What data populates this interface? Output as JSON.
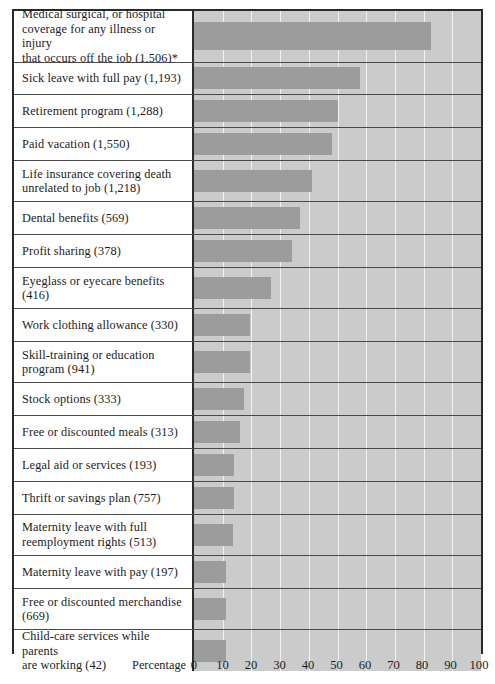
{
  "axis": {
    "caption": "Percentage",
    "ticks": [
      "0",
      "10",
      "20",
      "30",
      "40",
      "50",
      "60",
      "70",
      "80",
      "90",
      "100"
    ]
  },
  "colors": {
    "bar": "#9c9c9c",
    "plot_background": "#cbcbcb",
    "gridline": "#f2f2f2",
    "frame": "#2a2a2a",
    "text": "#1c1c1c"
  },
  "chart_data": {
    "type": "bar",
    "orientation": "horizontal",
    "title": "",
    "xlabel": "Percentage",
    "ylabel": "",
    "xlim": [
      0,
      100
    ],
    "grid": true,
    "legend": null,
    "footnote": "*",
    "categories": [
      "Medical surgical, or hospital coverage for any illness or injury that occurs off the job (1,506)*",
      "Sick leave with full pay (1,193)",
      "Retirement program (1,288)",
      "Paid vacation (1,550)",
      "Life insurance covering death unrelated to job (1,218)",
      "Dental benefits (569)",
      "Profit sharing (378)",
      "Eyeglass or eyecare benefits (416)",
      "Work clothing allowance (330)",
      "Skill-training or education program (941)",
      "Stock options (333)",
      "Free or discounted meals (313)",
      "Legal aid or services (193)",
      "Thrift or savings plan (757)",
      "Maternity leave with full reemployment rights (513)",
      "Maternity leave with pay (197)",
      "Free or discounted merchandise (669)",
      "Child-care services while parents are working (42)"
    ],
    "values": [
      82.5,
      58,
      50,
      48,
      41,
      37,
      34,
      27,
      19.5,
      19.5,
      17.5,
      16,
      14,
      14,
      13.5,
      11,
      11,
      11
    ],
    "counts": [
      1506,
      1193,
      1288,
      1550,
      1218,
      569,
      378,
      416,
      330,
      941,
      333,
      313,
      193,
      757,
      513,
      197,
      669,
      42
    ]
  },
  "rows": [
    {
      "label_line1": "Medical surgical, or hospital",
      "label_line2": "coverage for any illness or injury",
      "label_line3": "that occurs off the job (1,506)*",
      "value": 82.5,
      "lines": 3
    },
    {
      "label_line1": "Sick leave with full pay (1,193)",
      "label_line2": "",
      "label_line3": "",
      "value": 58,
      "lines": 1
    },
    {
      "label_line1": "Retirement program (1,288)",
      "label_line2": "",
      "label_line3": "",
      "value": 50,
      "lines": 1
    },
    {
      "label_line1": "Paid vacation (1,550)",
      "label_line2": "",
      "label_line3": "",
      "value": 48,
      "lines": 1
    },
    {
      "label_line1": "Life insurance covering death",
      "label_line2": "unrelated to job (1,218)",
      "label_line3": "",
      "value": 41,
      "lines": 2
    },
    {
      "label_line1": "Dental benefits (569)",
      "label_line2": "",
      "label_line3": "",
      "value": 37,
      "lines": 1
    },
    {
      "label_line1": "Profit sharing (378)",
      "label_line2": "",
      "label_line3": "",
      "value": 34,
      "lines": 1
    },
    {
      "label_line1": "Eyeglass or eyecare benefits",
      "label_line2": "(416)",
      "label_line3": "",
      "value": 27,
      "lines": 2
    },
    {
      "label_line1": "Work clothing allowance (330)",
      "label_line2": "",
      "label_line3": "",
      "value": 19.5,
      "lines": 1
    },
    {
      "label_line1": "Skill-training or education",
      "label_line2": "program (941)",
      "label_line3": "",
      "value": 19.5,
      "lines": 2
    },
    {
      "label_line1": "Stock options (333)",
      "label_line2": "",
      "label_line3": "",
      "value": 17.5,
      "lines": 1
    },
    {
      "label_line1": "Free or discounted meals (313)",
      "label_line2": "",
      "label_line3": "",
      "value": 16,
      "lines": 1
    },
    {
      "label_line1": "Legal aid or services (193)",
      "label_line2": "",
      "label_line3": "",
      "value": 14,
      "lines": 1
    },
    {
      "label_line1": "Thrift or savings plan (757)",
      "label_line2": "",
      "label_line3": "",
      "value": 14,
      "lines": 1
    },
    {
      "label_line1": "Maternity leave with full",
      "label_line2": "reemployment rights (513)",
      "label_line3": "",
      "value": 13.5,
      "lines": 2
    },
    {
      "label_line1": "Maternity leave with pay (197)",
      "label_line2": "",
      "label_line3": "",
      "value": 11,
      "lines": 1
    },
    {
      "label_line1": "Free or discounted merchandise",
      "label_line2": "(669)",
      "label_line3": "",
      "value": 11,
      "lines": 2
    },
    {
      "label_line1": "Child-care services while parents",
      "label_line2": "are working (42)",
      "label_line3": "",
      "value": 11,
      "lines": 2
    }
  ]
}
